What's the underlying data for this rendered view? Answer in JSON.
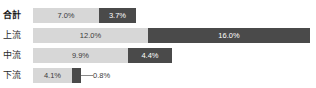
{
  "chart_data": {
    "type": "bar",
    "orientation": "horizontal",
    "stacked": true,
    "title": "",
    "xlabel": "",
    "ylabel": "",
    "grid": false,
    "legend": "none",
    "unit": "%",
    "categories": [
      "合計",
      "上流",
      "中流",
      "下流"
    ],
    "series": [
      {
        "name": "light",
        "color": "#d7d7d7",
        "values": [
          7.0,
          12.0,
          9.9,
          4.1
        ],
        "labels": [
          "7.0%",
          "12.0%",
          "9.9%",
          "4.1%"
        ]
      },
      {
        "name": "dark",
        "color": "#4a4a4a",
        "values": [
          3.7,
          16.0,
          4.4,
          0.8
        ],
        "labels": [
          "3.7%",
          "16.0%",
          "4.4%",
          "0.8%"
        ]
      }
    ],
    "xlim": [
      0,
      28
    ]
  },
  "rows": [
    {
      "label": "合計",
      "bold": true,
      "top": 8,
      "light": {
        "value": "7.0%",
        "x": 0,
        "w": 66
      },
      "dark": {
        "value": "3.7%",
        "x": 66,
        "w": 37
      },
      "callout": null
    },
    {
      "label": "上流",
      "bold": false,
      "top": 28,
      "light": {
        "value": "12.0%",
        "x": 0,
        "w": 115
      },
      "dark": {
        "value": "16.0%",
        "x": 115,
        "w": 162
      },
      "callout": null
    },
    {
      "label": "中流",
      "bold": false,
      "top": 48,
      "light": {
        "value": "9.9%",
        "x": 0,
        "w": 95
      },
      "dark": {
        "value": "4.4%",
        "x": 95,
        "w": 44
      },
      "callout": null
    },
    {
      "label": "下流",
      "bold": false,
      "top": 68,
      "light": {
        "value": "4.1%",
        "x": 0,
        "w": 39
      },
      "dark": {
        "value": "",
        "x": 39,
        "w": 9
      },
      "callout": {
        "value": "0.8%",
        "x": 60,
        "leader_x": 48,
        "leader_w": 12
      }
    }
  ],
  "colors": {
    "light_segment": "#d7d7d7",
    "dark_segment": "#4a4a4a",
    "label_text": "#2b2b2b",
    "background": "#ffffff"
  }
}
